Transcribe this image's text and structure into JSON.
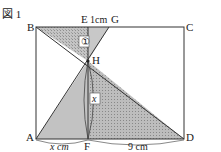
{
  "figure": {
    "title": "図 1",
    "points": {
      "A": "A",
      "B": "B",
      "C": "C",
      "D": "D",
      "E": "E",
      "F": "F",
      "G": "G",
      "H": "H"
    },
    "annotations": {
      "EG": "1cm",
      "AF": "x cm",
      "FD": "9 cm",
      "region1": "①",
      "regionX": "x"
    },
    "colors": {
      "line": "#333333",
      "fill": "#b0b0b0",
      "background": "#ffffff"
    }
  }
}
